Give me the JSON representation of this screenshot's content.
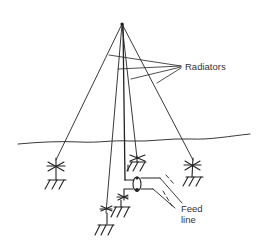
{
  "labels": {
    "radiators": "Radiators",
    "feed_line_1": "Feed",
    "feed_line_2": "line"
  },
  "colors": {
    "line": "#222222",
    "text": "#333333",
    "background": "#ffffff"
  },
  "elements": [
    "apex",
    "guy-wires",
    "radiator-wires",
    "ground-line",
    "insulators",
    "ground-symbols",
    "feed-line",
    "coaxial-coupler"
  ]
}
